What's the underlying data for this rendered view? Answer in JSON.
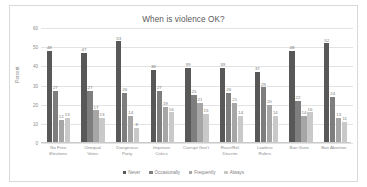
{
  "chart_data": {
    "type": "bar",
    "title": "When is violence OK?",
    "xlabel": "",
    "ylabel": "Percent",
    "ylim": [
      0,
      60
    ],
    "yticks": [
      0,
      10,
      20,
      30,
      40,
      50,
      60
    ],
    "grid": true,
    "legend_position": "bottom",
    "categories": [
      "No Free Elections",
      "Unequal Votes",
      "Dangerous Party",
      "Imprison Critics",
      "Corrupt Gov't",
      "Race/Rel. Discrim.",
      "Lawless Rulers",
      "Ban Guns",
      "Ban Abortion"
    ],
    "category_lines": [
      [
        "No Free",
        "Elections"
      ],
      [
        "Unequal",
        "Votes"
      ],
      [
        "Dangerous",
        "Party"
      ],
      [
        "Imprison",
        "Critics"
      ],
      [
        "Corrupt Gov't"
      ],
      [
        "Race/Rel.",
        "Discrim."
      ],
      [
        "Lawless",
        "Rulers"
      ],
      [
        "Ban Guns"
      ],
      [
        "Ban Abortion"
      ]
    ],
    "series": [
      {
        "name": "Never",
        "color": "#585858",
        "values": [
          48,
          47,
          53,
          38,
          39,
          39,
          37,
          48,
          52
        ]
      },
      {
        "name": "Occasionally",
        "color": "#7e7e7e",
        "values": [
          27,
          27,
          26,
          27,
          25,
          26,
          29,
          22,
          24
        ]
      },
      {
        "name": "Frequently",
        "color": "#a6a6a6",
        "values": [
          12,
          17,
          14,
          19,
          21,
          21,
          20,
          14,
          13
        ]
      },
      {
        "name": "Always",
        "color": "#c9c9c9",
        "values": [
          13,
          13,
          8,
          16,
          15,
          14,
          14,
          16,
          11
        ]
      }
    ]
  }
}
